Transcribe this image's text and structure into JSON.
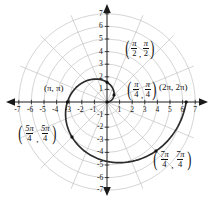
{
  "figure": {
    "title": "",
    "background_color": "#ffffff",
    "width": 214,
    "height": 199
  },
  "axes": {
    "x_ticks_negative": [
      "-7",
      "-6",
      "-5",
      "-4",
      "-3",
      "-2",
      "-1"
    ],
    "x_ticks_positive": [
      "1",
      "2",
      "3",
      "4",
      "5",
      "6",
      "7"
    ],
    "y_ticks_positive": [
      "7",
      "6",
      "5",
      "4",
      "3",
      "2",
      "1"
    ],
    "y_ticks_negative": [
      "-1",
      "-2",
      "-3",
      "-4",
      "-5",
      "-6",
      "-7"
    ],
    "xlim": [
      -7.6,
      7.6
    ],
    "ylim": [
      -7.6,
      7.6
    ],
    "axis_color": "#1a1a1a",
    "arrow_heads": [
      "left",
      "right",
      "up",
      "down"
    ]
  },
  "polar_grid": {
    "circle_radii": [
      1,
      2,
      3,
      4,
      5,
      6,
      7
    ],
    "radial_line_count": 8,
    "grid_color": "#b9b9b9"
  },
  "labels": {
    "pi_over_2": {
      "left": "π",
      "left_den": "2",
      "right": "π",
      "right_den": "2"
    },
    "pi_over_4": {
      "left": "π",
      "left_den": "4",
      "right": "π",
      "right_den": "4"
    },
    "five_pi_over_4": {
      "left": "5π",
      "left_den": "4",
      "right": "5π",
      "right_den": "4"
    },
    "seven_pi_over_4": {
      "left": "7π",
      "left_den": "4",
      "right": "7π",
      "right_den": "4"
    },
    "pi_pi": "(π, π)",
    "two_pi_two_pi": "(2π, 2π)",
    "comma": ","
  },
  "chart_data": {
    "type": "line",
    "title": "",
    "xlabel": "",
    "ylabel": "",
    "xlim": [
      -7.6,
      7.6
    ],
    "ylim": [
      -7.6,
      7.6
    ],
    "grid": "polar",
    "legend": "none",
    "curve_name": "r = θ",
    "curve_color": "#2b2b2b",
    "curve_description": "Archimedean spiral r = theta plotted for theta from 0 to 2pi",
    "theta_range": [
      0,
      6.2832
    ],
    "marked_points": [
      {
        "label": "(π/4, π/4)",
        "theta": 0.7854,
        "r": 0.7854,
        "x": 0.5554,
        "y": 0.5554
      },
      {
        "label": "(π/2, π/2)",
        "theta": 1.5708,
        "r": 1.5708,
        "x": 0.0,
        "y": 1.5708
      },
      {
        "label": "(π, π)",
        "theta": 3.1416,
        "r": 3.1416,
        "x": -3.1416,
        "y": 0.0
      },
      {
        "label": "(5π/4, 5π/4)",
        "theta": 3.927,
        "r": 3.927,
        "x": -2.7768,
        "y": -2.7768
      },
      {
        "label": "(7π/4, 7π/4)",
        "theta": 5.4978,
        "r": 5.4978,
        "x": 3.8875,
        "y": -3.8875
      },
      {
        "label": "(2π, 2π)",
        "theta": 6.2832,
        "r": 6.2832,
        "x": 6.2832,
        "y": 0.0
      },
      {
        "label": "origin",
        "theta": 0.0,
        "r": 0.0,
        "x": 0.0,
        "y": 0.0
      }
    ],
    "point_color": "#111111"
  }
}
